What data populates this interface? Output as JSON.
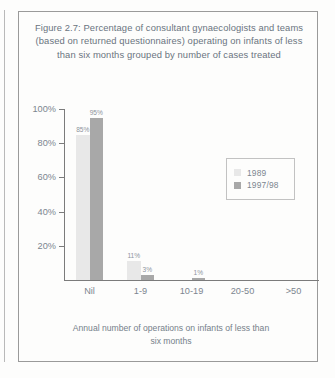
{
  "figure": {
    "title_lines": [
      "Figure 2.7: Percentage of consultant gynaecologists and teams",
      "(based on returned questionnaires) operating on infants of less",
      "than six months grouped by number of cases treated"
    ],
    "axis_caption_lines": [
      "Annual number of operations on infants of less than",
      "six months"
    ]
  },
  "chart_data": {
    "type": "bar",
    "title": "Figure 2.7: Percentage of consultant gynaecologists and teams (based on returned questionnaires) operating on infants of less than six months grouped by number of cases treated",
    "xlabel": "Annual number of operations on infants of less than six months",
    "ylabel": "",
    "ylim": [
      0,
      100
    ],
    "yticks": [
      "20%",
      "40%",
      "60%",
      "80%",
      "100%"
    ],
    "ytick_values": [
      20,
      40,
      60,
      80,
      100
    ],
    "grid": false,
    "legend_position": "center-right",
    "categories": [
      "Nil",
      "1-9",
      "10-19",
      "20-50",
      ">50"
    ],
    "series": [
      {
        "name": "1989",
        "color": "#e8e8e8",
        "values": [
          85,
          11,
          0,
          0,
          0
        ],
        "labels": [
          "85%",
          "11%",
          "",
          "",
          ""
        ]
      },
      {
        "name": "1997/98",
        "color": "#a8a8a8",
        "values": [
          95,
          3,
          1,
          0,
          0
        ],
        "labels": [
          "95%",
          "3%",
          "1%",
          "",
          ""
        ]
      }
    ]
  }
}
